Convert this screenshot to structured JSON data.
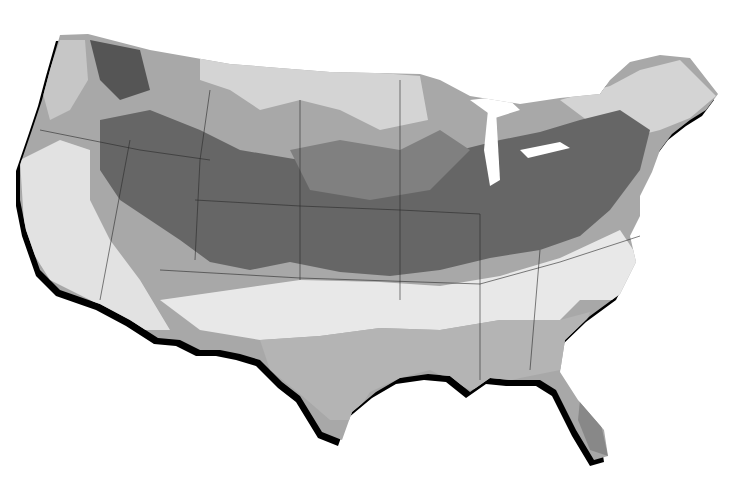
{
  "map": {
    "title": "",
    "region": "Contiguous United States",
    "style": "grayscale choropleth with drop shadow",
    "colors": {
      "background": "#ffffff",
      "shadow": "#000000",
      "level_1_lightest": "#f4f4f4",
      "level_2_light": "#d4d4d4",
      "level_3_mid": "#a8a8a8",
      "level_4_dark": "#808080",
      "level_5_darkest": "#555555",
      "borders": "#2a2a2a"
    }
  }
}
